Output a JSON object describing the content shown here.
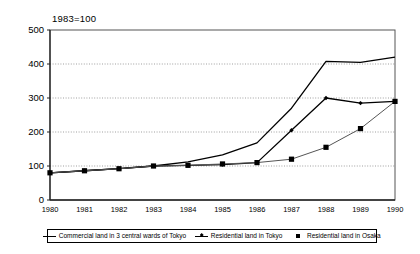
{
  "chart_data": {
    "type": "line",
    "title": "",
    "annotation": "1983=100",
    "xlabel": "",
    "ylabel": "",
    "x": [
      1980,
      1981,
      1982,
      1983,
      1984,
      1985,
      1986,
      1987,
      1988,
      1989,
      1990
    ],
    "categories": [
      "1980",
      "1981",
      "1982",
      "1983",
      "1984",
      "1985",
      "1986",
      "1987",
      "1988",
      "1989",
      "1990"
    ],
    "ylim": [
      0,
      500
    ],
    "yticks": [
      0,
      100,
      200,
      300,
      400,
      500
    ],
    "ytick_labels": [
      "0",
      "100",
      "200",
      "300",
      "400",
      "500"
    ],
    "grid": "horizontal-dotted",
    "legend_position": "bottom",
    "series": [
      {
        "name": "Commercial land in 3 central wards of Tokyo",
        "marker": "none",
        "color": "#000000",
        "values": [
          80,
          86,
          92,
          100,
          112,
          133,
          168,
          270,
          408,
          405,
          420
        ]
      },
      {
        "name": "Residential land in Tokyo",
        "marker": "diamond",
        "color": "#000000",
        "values": [
          80,
          86,
          92,
          100,
          102,
          104,
          110,
          205,
          300,
          285,
          290
        ]
      },
      {
        "name": "Residential land in Osaka",
        "marker": "square",
        "color": "#000000",
        "values": [
          80,
          86,
          92,
          100,
          102,
          106,
          110,
          120,
          155,
          210,
          290
        ]
      }
    ]
  }
}
